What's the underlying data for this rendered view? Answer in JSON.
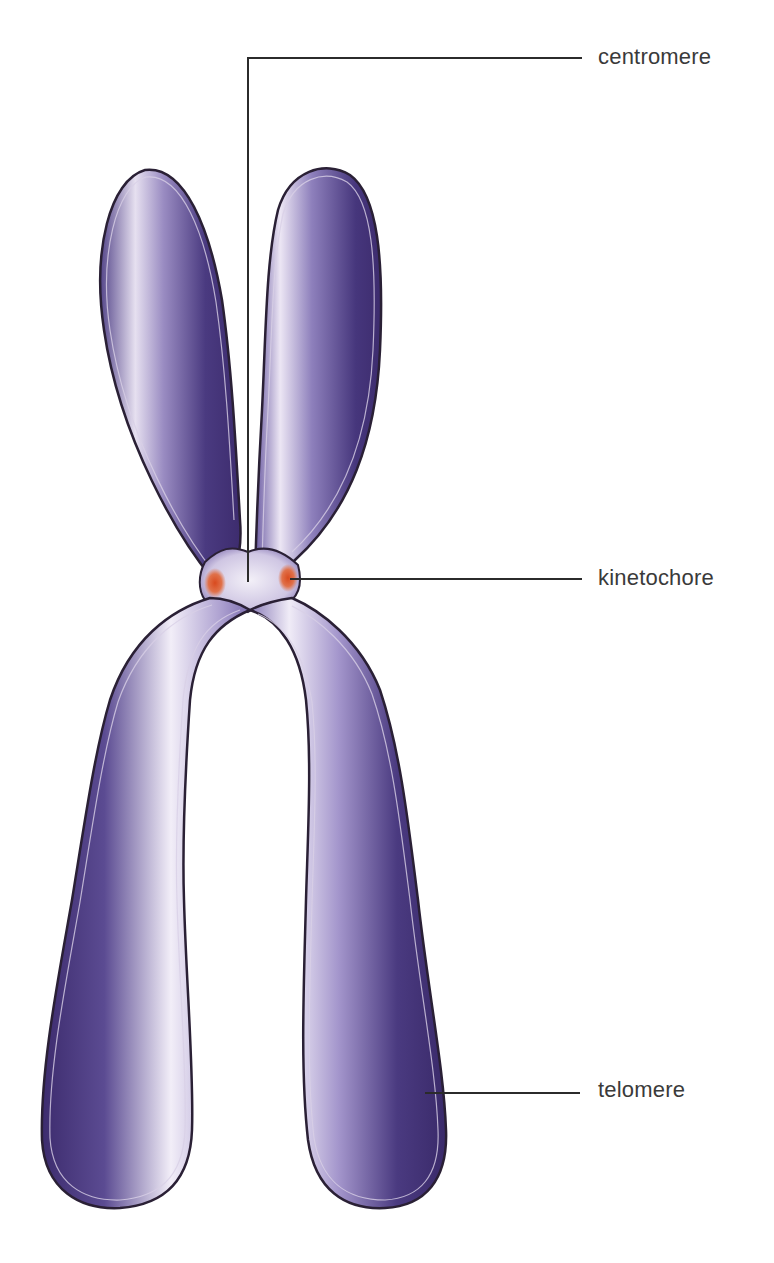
{
  "colors": {
    "chromatid_dark": "#3d2c6e",
    "chromatid_mid": "#6a58a0",
    "chromatid_light": "#e9e3f3",
    "outline": "#2a2035",
    "kinetochore": "#d9552a",
    "leader_line": "#2b2b2b",
    "label_text": "#3a3a3a"
  },
  "labels": [
    {
      "id": "centromere",
      "text": "centromere",
      "x": 598,
      "y": 44
    },
    {
      "id": "kinetochore",
      "text": "kinetochore",
      "x": 598,
      "y": 565
    },
    {
      "id": "telomere",
      "text": "telomere",
      "x": 598,
      "y": 1077
    }
  ],
  "leader_lines": {
    "centromere": [
      [
        582,
        58
      ],
      [
        248,
        58
      ],
      [
        248,
        582
      ]
    ],
    "kinetochore": [
      [
        290,
        579
      ],
      [
        582,
        579
      ]
    ],
    "telomere": [
      [
        425,
        1093
      ],
      [
        580,
        1093
      ]
    ]
  }
}
